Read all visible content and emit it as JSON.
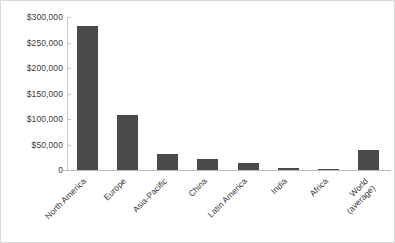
{
  "chart_data": {
    "type": "bar",
    "title": "",
    "subtitle": "",
    "xlabel": "",
    "ylabel": "",
    "categories": [
      "North America",
      "Europe",
      "Asia-Pacific",
      "China",
      "Latin America",
      "India",
      "Africa",
      "World\n(average)"
    ],
    "values": [
      282000,
      107000,
      32000,
      22000,
      14000,
      4500,
      2500,
      39000
    ],
    "ylim": [
      0,
      300000
    ],
    "ytick_values": [
      300000,
      250000,
      200000,
      150000,
      100000,
      50000,
      0
    ],
    "ytick_labels": [
      "$300,000",
      "$250,000",
      "$200,000",
      "$150,000",
      "$100,000",
      "$50,000",
      "0"
    ],
    "grid": false,
    "legend": null,
    "legend_position": "none",
    "bar_color": "#4a4a4a",
    "axis_color": "#c9c9c9",
    "text_color": "#3b3b3b",
    "border_color": "#d9d9d9"
  }
}
